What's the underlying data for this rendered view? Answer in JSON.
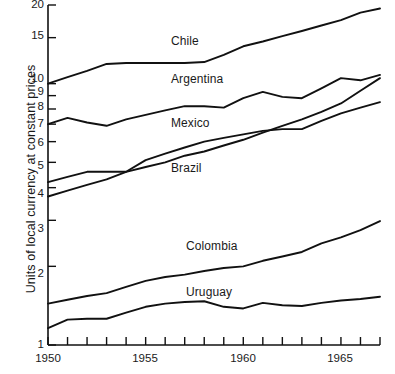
{
  "chart_data": {
    "type": "line",
    "title": "",
    "xlabel": "",
    "ylabel": "Units of local currency at constant prices",
    "yscale": "log",
    "ylim": [
      1,
      20
    ],
    "xlim": [
      1950,
      1967
    ],
    "grid": false,
    "legend_position": "inline-labels",
    "y_ticks": [
      {
        "value": 20,
        "label": "20"
      },
      {
        "value": 15,
        "label": "15"
      },
      {
        "value": 10,
        "label": "10"
      },
      {
        "value": 9,
        "label": "9"
      },
      {
        "value": 8,
        "label": "8"
      },
      {
        "value": 7,
        "label": "7"
      },
      {
        "value": 6,
        "label": "6"
      },
      {
        "value": 5,
        "label": "5"
      },
      {
        "value": 4,
        "label": "4"
      },
      {
        "value": 3,
        "label": "3"
      },
      {
        "value": 2,
        "label": "2"
      },
      {
        "value": 1,
        "label": "1"
      }
    ],
    "x_ticks_all": [
      1950,
      1951,
      1952,
      1953,
      1954,
      1955,
      1956,
      1957,
      1958,
      1959,
      1960,
      1961,
      1962,
      1963,
      1964,
      1965,
      1966,
      1967
    ],
    "x_tick_labels": [
      {
        "value": 1950,
        "label": "1950"
      },
      {
        "value": 1955,
        "label": "1955"
      },
      {
        "value": 1960,
        "label": "1960"
      },
      {
        "value": 1965,
        "label": "1965"
      }
    ],
    "x": [
      1950,
      1951,
      1952,
      1953,
      1954,
      1955,
      1956,
      1957,
      1958,
      1959,
      1960,
      1961,
      1962,
      1963,
      1964,
      1965,
      1966,
      1967
    ],
    "series": [
      {
        "name": "Chile",
        "label": "Chile",
        "color": "#111111",
        "values": [
          10.0,
          10.6,
          11.2,
          11.9,
          12.0,
          12.0,
          12.0,
          12.0,
          12.1,
          12.9,
          13.9,
          14.5,
          15.2,
          15.9,
          16.7,
          17.5,
          18.7,
          19.4
        ]
      },
      {
        "name": "Argentina",
        "label": "Argentina",
        "color": "#111111",
        "values": [
          7.0,
          7.4,
          7.1,
          6.9,
          7.3,
          7.6,
          7.9,
          8.2,
          8.2,
          8.1,
          8.8,
          9.3,
          8.9,
          8.8,
          9.6,
          10.5,
          10.3,
          10.8
        ]
      },
      {
        "name": "Mexico",
        "label": "Mexico",
        "color": "#111111",
        "values": [
          4.2,
          4.4,
          4.6,
          4.6,
          4.6,
          5.1,
          5.4,
          5.7,
          6.0,
          6.2,
          6.4,
          6.6,
          6.7,
          6.7,
          7.2,
          7.7,
          8.1,
          8.5
        ]
      },
      {
        "name": "Brazil",
        "label": "Brazil",
        "color": "#111111",
        "values": [
          3.7,
          3.9,
          4.1,
          4.3,
          4.6,
          4.8,
          5.0,
          5.3,
          5.5,
          5.8,
          6.1,
          6.5,
          6.9,
          7.3,
          7.8,
          8.4,
          9.4,
          10.5
        ]
      },
      {
        "name": "Colombia",
        "label": "Colombia",
        "color": "#111111",
        "values": [
          1.44,
          1.49,
          1.54,
          1.58,
          1.67,
          1.76,
          1.82,
          1.86,
          1.92,
          1.97,
          2.0,
          2.1,
          2.18,
          2.27,
          2.45,
          2.58,
          2.75,
          2.98
        ]
      },
      {
        "name": "Uruguay",
        "label": "Uruguay",
        "color": "#111111",
        "values": [
          1.16,
          1.25,
          1.26,
          1.26,
          1.33,
          1.4,
          1.44,
          1.46,
          1.47,
          1.4,
          1.38,
          1.45,
          1.42,
          1.41,
          1.45,
          1.48,
          1.5,
          1.53
        ]
      }
    ],
    "inline_labels": [
      {
        "text": "Chile",
        "x": 1956.4,
        "y": 14.7
      },
      {
        "text": "Argentina",
        "x": 1956.3,
        "y": 10.4
      },
      {
        "text": "Mexico",
        "x": 1956.3,
        "y": 6.85
      },
      {
        "text": "Brazil",
        "x": 1956.4,
        "y": 4.72
      },
      {
        "text": "Colombia",
        "x": 1957.0,
        "y": 2.26
      },
      {
        "text": "Uruguay",
        "x": 1957.0,
        "y": 1.6
      }
    ]
  },
  "axes": {
    "y_axis_name": "y-axis",
    "x_axis_name": "x-axis"
  }
}
